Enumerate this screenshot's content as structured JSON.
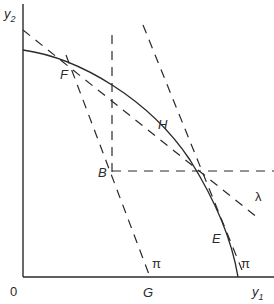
{
  "diagram": {
    "axes": {
      "y_label": "y",
      "y_sub": "2",
      "x_label": "y",
      "x_sub": "1",
      "origin_label": "0"
    },
    "points": {
      "F": "F",
      "H": "H",
      "B": "B",
      "E": "E",
      "G": "G"
    },
    "line_labels": {
      "pi_left": "π",
      "pi_right": "π",
      "lambda": "λ"
    },
    "colors": {
      "ink": "#2a2a2a",
      "background": "#ffffff"
    }
  }
}
